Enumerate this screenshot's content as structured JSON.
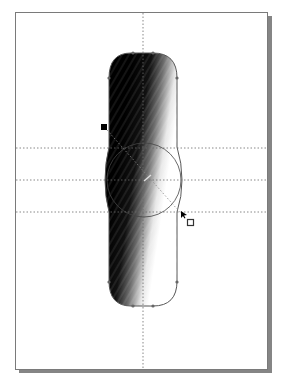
{
  "document": {
    "type": "drawing-page",
    "page_color": "#ffffff",
    "border_color": "#7a7a7a",
    "shadow_color": "#8a8a8a"
  },
  "guides": {
    "horizontal_count": 3,
    "vertical_count": 1,
    "color": "#6a6a6a"
  },
  "shape": {
    "kind": "rounded-capsule",
    "fill": "linear-gradient",
    "gradient_start_color": "#000000",
    "gradient_end_color": "#ffffff",
    "outline_color": "#555555",
    "node_count": 8
  },
  "interactive_fill_tool": {
    "start_handle_color": "#000000",
    "end_handle_color": "#ffffff",
    "midpoint_slider": true,
    "cursor": "interactive-fill-cursor"
  },
  "ellipse": {
    "outline_color": "#444444"
  }
}
